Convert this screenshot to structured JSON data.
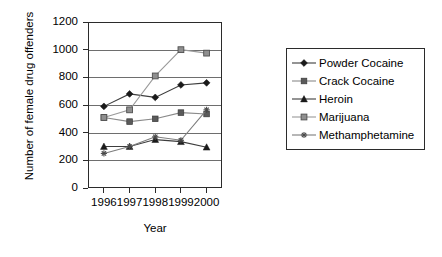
{
  "chart_data": {
    "type": "line",
    "title": "",
    "xlabel": "Year",
    "ylabel": "Number of female drug offenders",
    "categories": [
      "1996",
      "1997",
      "1998",
      "1999",
      "2000"
    ],
    "x": [
      1996,
      1997,
      1998,
      1999,
      2000
    ],
    "ylim": [
      0,
      1200
    ],
    "yticks": [
      0,
      200,
      400,
      600,
      800,
      1000,
      1200
    ],
    "ytick_labels": [
      "0",
      "200",
      "400",
      "600",
      "800",
      "1000",
      "1200"
    ],
    "grid": true,
    "grid_axis": "y",
    "legend_position": "right",
    "series": [
      {
        "name": "Powder Cocaine",
        "marker": "diamond",
        "color": "#1a1a1a",
        "line_color": "#3d3d3d",
        "values": [
          590,
          680,
          655,
          745,
          760
        ]
      },
      {
        "name": "Crack Cocaine",
        "marker": "square",
        "color": "#5a5a5a",
        "line_color": "#8a8a8a",
        "values": [
          510,
          480,
          500,
          545,
          535
        ]
      },
      {
        "name": "Heroin",
        "marker": "triangle",
        "color": "#1a1a1a",
        "line_color": "#3d3d3d",
        "values": [
          300,
          300,
          350,
          335,
          295
        ]
      },
      {
        "name": "Marijuana",
        "marker": "square-outline",
        "color": "#8f8f8f",
        "line_color": "#9a9a9a",
        "values": [
          510,
          565,
          810,
          1000,
          975
        ]
      },
      {
        "name": "Methamphetamine",
        "marker": "asterisk",
        "color": "#4a4a4a",
        "line_color": "#7d7d7d",
        "values": [
          250,
          300,
          370,
          345,
          565
        ]
      }
    ]
  },
  "legend": {
    "entries": [
      {
        "label": "Powder Cocaine"
      },
      {
        "label": "Crack Cocaine"
      },
      {
        "label": "Heroin"
      },
      {
        "label": "Marijuana"
      },
      {
        "label": "Methamphetamine"
      }
    ]
  },
  "axes": {
    "y_title": "Number of female drug offenders",
    "x_title": "Year"
  },
  "colors": {
    "axis": "#2b2b2b",
    "grid": "#6e6e6e",
    "background": "#ffffff"
  }
}
